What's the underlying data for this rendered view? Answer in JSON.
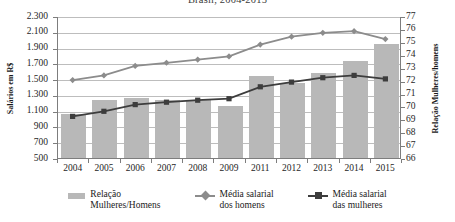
{
  "chart_data": {
    "type": "bar",
    "title": "Brasil, 2004-2015",
    "xlabel": "",
    "ylabel": "Salários em R$",
    "y2label": "Relação Mulheres/homens",
    "categories": [
      "2004",
      "2005",
      "2006",
      "2007",
      "2008",
      "2009",
      "2011",
      "2012",
      "2013",
      "2014",
      "2015"
    ],
    "ylim": [
      500,
      2300
    ],
    "y2lim": [
      66,
      77
    ],
    "yticks": [
      "500",
      "700",
      "900",
      "1.100",
      "1.300",
      "1.500",
      "1.700",
      "1.900",
      "2.100",
      "2.300"
    ],
    "ytick_values": [
      500,
      700,
      900,
      1100,
      1300,
      1500,
      1700,
      1900,
      2100,
      2300
    ],
    "y2ticks": [
      "66",
      "67",
      "68",
      "69",
      "70",
      "71",
      "72",
      "73",
      "74",
      "75",
      "76",
      "77"
    ],
    "y2tick_values": [
      66,
      67,
      68,
      69,
      70,
      71,
      72,
      73,
      74,
      75,
      76,
      77
    ],
    "grid": true,
    "legend_position": "bottom",
    "series": [
      {
        "name": "Relação Mulheres/Homens",
        "type": "bar",
        "axis": "right",
        "color": "#b8b8b8",
        "values": [
          69.5,
          70.6,
          70.7,
          70.6,
          70.6,
          70.1,
          72.4,
          71.9,
          72.7,
          73.6,
          74.9
        ]
      },
      {
        "name": "Média salarial dos homens",
        "type": "line",
        "axis": "left",
        "color": "#8c8c8c",
        "marker": "diamond",
        "values": [
          1500,
          1560,
          1680,
          1720,
          1760,
          1800,
          1950,
          2050,
          2100,
          2120,
          2020
        ]
      },
      {
        "name": "Média salarial das mulheres",
        "type": "line",
        "axis": "left",
        "color": "#3d3d3d",
        "marker": "square",
        "values": [
          1040,
          1105,
          1190,
          1220,
          1245,
          1265,
          1415,
          1475,
          1530,
          1560,
          1515
        ]
      }
    ]
  },
  "legend": {
    "items": [
      {
        "line1": "Relação",
        "line2": "Mulheres/Homens"
      },
      {
        "line1": "Média salarial",
        "line2": "dos homens"
      },
      {
        "line1": "Média salarial",
        "line2": "das mulheres"
      }
    ]
  }
}
